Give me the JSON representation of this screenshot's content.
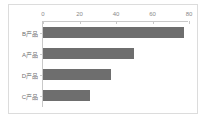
{
  "chart_data": {
    "type": "bar",
    "orientation": "horizontal",
    "title": "",
    "xlabel": "",
    "ylabel": "",
    "categories": [
      "B产品",
      "A产品",
      "D产品",
      "C产品"
    ],
    "values": [
      77,
      50,
      37,
      26
    ],
    "xticks": [
      0,
      20,
      40,
      60,
      80
    ],
    "xlim": [
      0,
      80
    ],
    "grid": false,
    "legend": false,
    "series": [
      {
        "name": "",
        "values": [
          77,
          50,
          37,
          26
        ]
      }
    ]
  },
  "style": {
    "bar_color": "#6e6e6e",
    "axis_color": "#c9c9c9",
    "tick_label_color": "#8a8a8a",
    "category_label_color": "#707070",
    "frame_border_color": "#dcdcdc",
    "background": "#ffffff"
  }
}
